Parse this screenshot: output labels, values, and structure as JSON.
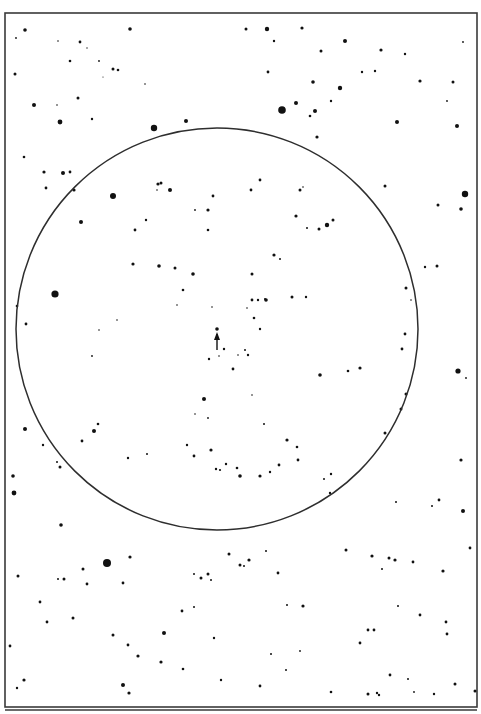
{
  "chart": {
    "kind": "star finder chart",
    "frame": {
      "x": 5,
      "y": 13,
      "w": 472,
      "h": 694,
      "stroke": "#3a3a3a"
    },
    "lower_frame_line": {
      "y": 710,
      "x1": 5,
      "x2": 477
    },
    "field_circle": {
      "cx": 217,
      "cy": 329,
      "r": 201,
      "stroke": "#2e2e2e"
    },
    "target": {
      "x": 217,
      "y": 331,
      "marker": "arrow-up",
      "label": "target star"
    },
    "ink_color": "#111111",
    "background": "#ffffff"
  },
  "stars": [
    [
      25,
      30,
      1.8
    ],
    [
      16,
      38,
      0.9
    ],
    [
      80,
      42,
      1.4
    ],
    [
      130,
      29,
      1.8
    ],
    [
      58,
      41,
      0.8
    ],
    [
      87,
      48,
      0.7
    ],
    [
      70,
      61,
      1.3
    ],
    [
      99,
      61,
      0.9
    ],
    [
      113,
      69,
      1.5
    ],
    [
      118,
      70,
      1.3
    ],
    [
      103,
      77,
      0.6
    ],
    [
      145,
      84,
      0.8
    ],
    [
      78,
      98,
      1.5
    ],
    [
      15,
      74,
      1.5
    ],
    [
      34,
      105,
      2.0
    ],
    [
      60,
      122,
      2.4
    ],
    [
      57,
      105,
      0.8
    ],
    [
      154,
      128,
      3.2
    ],
    [
      186,
      121,
      2.0
    ],
    [
      92,
      119,
      1.2
    ],
    [
      24,
      157,
      1.3
    ],
    [
      44,
      172,
      1.6
    ],
    [
      70,
      172,
      1.4
    ],
    [
      63,
      173,
      2.0
    ],
    [
      246,
      29,
      1.5
    ],
    [
      267,
      29,
      2.2
    ],
    [
      302,
      28,
      1.6
    ],
    [
      274,
      41,
      1.2
    ],
    [
      345,
      41,
      2.0
    ],
    [
      321,
      51,
      1.5
    ],
    [
      381,
      50,
      1.6
    ],
    [
      405,
      54,
      1.2
    ],
    [
      268,
      72,
      1.4
    ],
    [
      313,
      82,
      1.8
    ],
    [
      362,
      72,
      1.2
    ],
    [
      375,
      71,
      1.2
    ],
    [
      340,
      88,
      2.2
    ],
    [
      331,
      101,
      1.2
    ],
    [
      282,
      110,
      3.8
    ],
    [
      296,
      103,
      2.0
    ],
    [
      315,
      111,
      2.0
    ],
    [
      310,
      116,
      1.3
    ],
    [
      317,
      137,
      1.6
    ],
    [
      397,
      122,
      2.0
    ],
    [
      457,
      126,
      2.0
    ],
    [
      420,
      81,
      1.6
    ],
    [
      453,
      82,
      1.5
    ],
    [
      463,
      42,
      0.9
    ],
    [
      447,
      101,
      0.9
    ],
    [
      74,
      190,
      1.6
    ],
    [
      46,
      188,
      1.4
    ],
    [
      113,
      196,
      3.0
    ],
    [
      81,
      222,
      2.0
    ],
    [
      112,
      196,
      1.2
    ],
    [
      135,
      230,
      1.4
    ],
    [
      146,
      220,
      1.2
    ],
    [
      161,
      183,
      1.5
    ],
    [
      157,
      190,
      0.8
    ],
    [
      158,
      184,
      1.6
    ],
    [
      170,
      190,
      2.0
    ],
    [
      208,
      210,
      1.6
    ],
    [
      213,
      196,
      1.4
    ],
    [
      195,
      210,
      0.9
    ],
    [
      133,
      264,
      1.6
    ],
    [
      159,
      266,
      1.8
    ],
    [
      175,
      268,
      1.5
    ],
    [
      193,
      274,
      1.8
    ],
    [
      183,
      290,
      1.3
    ],
    [
      208,
      230,
      1.3
    ],
    [
      251,
      190,
      1.4
    ],
    [
      260,
      180,
      1.4
    ],
    [
      300,
      190,
      1.5
    ],
    [
      327,
      225,
      2.2
    ],
    [
      333,
      220,
      1.5
    ],
    [
      319,
      229,
      1.5
    ],
    [
      303,
      187,
      0.8
    ],
    [
      385,
      186,
      1.5
    ],
    [
      438,
      205,
      1.5
    ],
    [
      465,
      194,
      3.2
    ],
    [
      461,
      209,
      1.8
    ],
    [
      437,
      266,
      1.5
    ],
    [
      425,
      267,
      1.2
    ],
    [
      406,
      288,
      1.5
    ],
    [
      405,
      334,
      1.4
    ],
    [
      402,
      349,
      1.4
    ],
    [
      406,
      394,
      1.5
    ],
    [
      411,
      300,
      0.8
    ],
    [
      274,
      255,
      1.6
    ],
    [
      296,
      216,
      1.6
    ],
    [
      280,
      259,
      1.0
    ],
    [
      307,
      228,
      1.0
    ],
    [
      55,
      294,
      3.6
    ],
    [
      26,
      324,
      1.4
    ],
    [
      17,
      306,
      1.3
    ],
    [
      92,
      356,
      0.9
    ],
    [
      99,
      330,
      0.8
    ],
    [
      117,
      320,
      0.8
    ],
    [
      177,
      305,
      0.8
    ],
    [
      212,
      307,
      0.8
    ],
    [
      252,
      274,
      1.5
    ],
    [
      266,
      300,
      1.8
    ],
    [
      254,
      318,
      1.3
    ],
    [
      247,
      308,
      0.8
    ],
    [
      258,
      300,
      1.2
    ],
    [
      265,
      299,
      1.0
    ],
    [
      292,
      297,
      1.5
    ],
    [
      306,
      297,
      1.2
    ],
    [
      260,
      329,
      1.2
    ],
    [
      252,
      300,
      1.4
    ],
    [
      224,
      349,
      1.2
    ],
    [
      248,
      355,
      1.2
    ],
    [
      245,
      350,
      1.0
    ],
    [
      238,
      355,
      0.8
    ],
    [
      233,
      369,
      1.4
    ],
    [
      209,
      359,
      1.2
    ],
    [
      219,
      356,
      0.8
    ],
    [
      360,
      368,
      1.6
    ],
    [
      320,
      375,
      1.8
    ],
    [
      348,
      371,
      1.3
    ],
    [
      25,
      429,
      2.0
    ],
    [
      43,
      445,
      1.2
    ],
    [
      60,
      467,
      1.5
    ],
    [
      57,
      462,
      1.0
    ],
    [
      61,
      525,
      1.8
    ],
    [
      82,
      441,
      1.4
    ],
    [
      94,
      431,
      2.0
    ],
    [
      98,
      424,
      1.3
    ],
    [
      14,
      493,
      2.4
    ],
    [
      13,
      476,
      1.8
    ],
    [
      128,
      458,
      1.2
    ],
    [
      147,
      454,
      1.0
    ],
    [
      204,
      399,
      2.0
    ],
    [
      195,
      414,
      0.8
    ],
    [
      187,
      445,
      1.2
    ],
    [
      208,
      418,
      0.9
    ],
    [
      252,
      395,
      0.8
    ],
    [
      264,
      424,
      1.0
    ],
    [
      226,
      464,
      1.2
    ],
    [
      216,
      469,
      1.2
    ],
    [
      211,
      450,
      1.6
    ],
    [
      260,
      476,
      1.6
    ],
    [
      240,
      476,
      1.8
    ],
    [
      237,
      468,
      1.3
    ],
    [
      194,
      456,
      1.4
    ],
    [
      220,
      470,
      1.1
    ],
    [
      287,
      440,
      1.6
    ],
    [
      297,
      447,
      1.3
    ],
    [
      298,
      460,
      1.4
    ],
    [
      324,
      479,
      1.0
    ],
    [
      331,
      474,
      1.2
    ],
    [
      330,
      493,
      1.2
    ],
    [
      270,
      472,
      1.2
    ],
    [
      279,
      465,
      1.4
    ],
    [
      385,
      433,
      1.5
    ],
    [
      346,
      550,
      1.5
    ],
    [
      382,
      569,
      1.0
    ],
    [
      389,
      558,
      1.5
    ],
    [
      458,
      371,
      2.6
    ],
    [
      466,
      378,
      0.9
    ],
    [
      463,
      511,
      2.0
    ],
    [
      401,
      409,
      1.5
    ],
    [
      461,
      460,
      1.6
    ],
    [
      439,
      500,
      1.4
    ],
    [
      432,
      506,
      1.0
    ],
    [
      396,
      502,
      1.0
    ],
    [
      107,
      563,
      4.0
    ],
    [
      130,
      557,
      1.6
    ],
    [
      83,
      569,
      1.5
    ],
    [
      18,
      576,
      1.5
    ],
    [
      64,
      579,
      1.5
    ],
    [
      58,
      579,
      1.0
    ],
    [
      87,
      584,
      1.4
    ],
    [
      123,
      583,
      1.4
    ],
    [
      229,
      554,
      1.5
    ],
    [
      208,
      574,
      1.5
    ],
    [
      201,
      578,
      1.5
    ],
    [
      194,
      574,
      1.0
    ],
    [
      211,
      580,
      1.0
    ],
    [
      240,
      565,
      1.5
    ],
    [
      244,
      566,
      1.0
    ],
    [
      249,
      560,
      1.6
    ],
    [
      266,
      551,
      1.0
    ],
    [
      278,
      573,
      1.4
    ],
    [
      372,
      556,
      1.6
    ],
    [
      395,
      560,
      1.6
    ],
    [
      413,
      562,
      1.4
    ],
    [
      443,
      571,
      1.6
    ],
    [
      470,
      548,
      1.4
    ],
    [
      287,
      605,
      1.0
    ],
    [
      40,
      602,
      1.4
    ],
    [
      73,
      618,
      1.5
    ],
    [
      47,
      622,
      1.4
    ],
    [
      164,
      633,
      2.0
    ],
    [
      113,
      635,
      1.5
    ],
    [
      128,
      645,
      1.4
    ],
    [
      138,
      656,
      1.6
    ],
    [
      161,
      662,
      1.6
    ],
    [
      123,
      685,
      2.0
    ],
    [
      129,
      693,
      1.6
    ],
    [
      24,
      680,
      1.6
    ],
    [
      17,
      688,
      1.2
    ],
    [
      182,
      611,
      1.4
    ],
    [
      303,
      606,
      1.6
    ],
    [
      368,
      630,
      1.4
    ],
    [
      374,
      630,
      1.4
    ],
    [
      360,
      643,
      1.4
    ],
    [
      420,
      615,
      1.4
    ],
    [
      446,
      622,
      1.4
    ],
    [
      447,
      634,
      1.4
    ],
    [
      455,
      684,
      1.5
    ],
    [
      475,
      691,
      1.5
    ],
    [
      390,
      675,
      1.4
    ],
    [
      331,
      692,
      1.3
    ],
    [
      377,
      693,
      1.2
    ],
    [
      379,
      695,
      1.2
    ],
    [
      368,
      694,
      1.5
    ],
    [
      300,
      651,
      0.9
    ],
    [
      286,
      670,
      1.0
    ],
    [
      271,
      654,
      1.0
    ],
    [
      183,
      669,
      1.3
    ],
    [
      221,
      680,
      1.2
    ],
    [
      260,
      686,
      1.4
    ],
    [
      10,
      646,
      1.4
    ],
    [
      214,
      638,
      1.2
    ],
    [
      194,
      607,
      1.0
    ],
    [
      398,
      606,
      1.0
    ],
    [
      408,
      679,
      1.0
    ],
    [
      434,
      694,
      1.2
    ],
    [
      414,
      692,
      0.9
    ]
  ]
}
